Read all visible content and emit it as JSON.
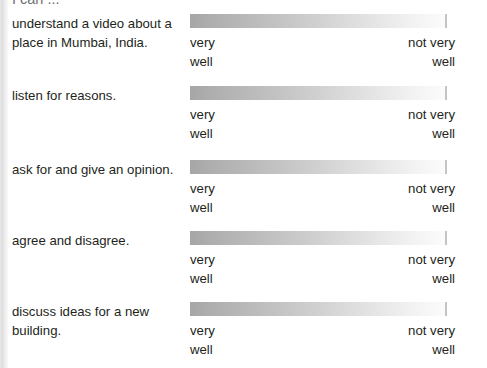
{
  "document": {
    "heading": "I can ...",
    "scale": {
      "low_label": "very\nwell",
      "high_label": "not very\nwell",
      "gradient_from": "#a6a6a6",
      "gradient_to": "#fcfcfc"
    },
    "items": [
      {
        "text": "understand a video about a place in Mumbai, India.",
        "low_label": "very\nwell",
        "high_label": "not very\nwell"
      },
      {
        "text": "listen for reasons.",
        "low_label": "very\nwell",
        "high_label": "not very\nwell"
      },
      {
        "text": "ask for and give an opinion.",
        "low_label": "very\nwell",
        "high_label": "not very\nwell"
      },
      {
        "text": "agree and disagree.",
        "low_label": "very\nwell",
        "high_label": "not very\nwell"
      },
      {
        "text": "discuss ideas for a new building.",
        "low_label": "very\nwell",
        "high_label": "not very\nwell"
      }
    ]
  }
}
